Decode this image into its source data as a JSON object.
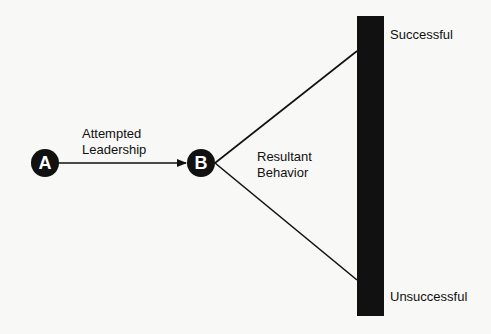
{
  "diagram": {
    "nodes": [
      {
        "id": "A",
        "label": "A"
      },
      {
        "id": "B",
        "label": "B"
      }
    ],
    "edge_label": {
      "line1": "Attempted",
      "line2": "Leadership"
    },
    "branch_label": {
      "line1": "Resultant",
      "line2": "Behavior"
    },
    "scale": {
      "top_label": "Successful",
      "bottom_label": "Unsuccessful"
    },
    "colors": {
      "ink": "#111111",
      "background": "#f8f8f6",
      "node_text": "#ffffff"
    }
  }
}
